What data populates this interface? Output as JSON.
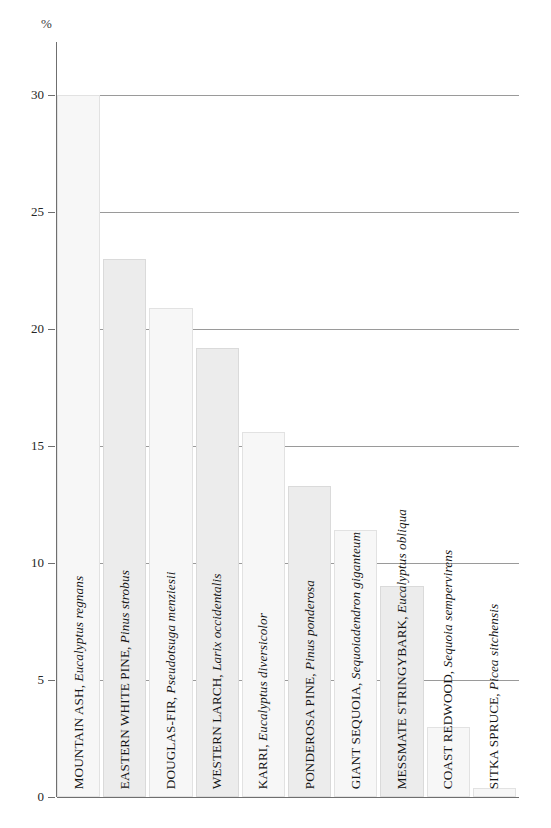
{
  "chart_data": {
    "type": "bar",
    "title": "",
    "subtitle": "",
    "xlabel": "",
    "ylabel": "%",
    "unit_label": "%",
    "ylim": [
      0,
      32
    ],
    "yticks": [
      0,
      5,
      10,
      15,
      20,
      25,
      30
    ],
    "ytick_labels": [
      "0",
      "5",
      "10",
      "15",
      "20",
      "25",
      "30"
    ],
    "grid": true,
    "legend": null,
    "orientation": "vertical",
    "categories": [
      "MOUNTAIN ASH, Eucalyptus regnans",
      "EASTERN WHITE PINE, Pinus strobus",
      "DOUGLAS-FIR, Pseudotsuga menziesii",
      "WESTERN LARCH, Larix occidentalis",
      "KARRI, Eucalyptus diversicolor",
      "PONDEROSA PINE, Pinus ponderosa",
      "GIANT SEQUOIA, Sequoiadendron giganteum",
      "MESSMATE STRINGYBARK, Eucalyptus obliqua",
      "COAST REDWOOD, Sequoia sempervirens",
      "SITKA SPRUCE, Picea sitchensis"
    ],
    "values": [
      30.0,
      23.0,
      20.9,
      19.2,
      15.6,
      13.3,
      11.4,
      9.0,
      3.0,
      0.4
    ],
    "bars": [
      {
        "common": "MOUNTAIN ASH, ",
        "latin": "Eucalyptus regnans",
        "value": 30.0,
        "shade": "a"
      },
      {
        "common": "EASTERN WHITE PINE, ",
        "latin": "Pinus strobus",
        "value": 23.0,
        "shade": "b"
      },
      {
        "common": "DOUGLAS-FIR, ",
        "latin": "Pseudotsuga menziesii",
        "value": 20.9,
        "shade": "a"
      },
      {
        "common": "WESTERN LARCH, ",
        "latin": "Larix occidentalis",
        "value": 19.2,
        "shade": "b"
      },
      {
        "common": "KARRI, ",
        "latin": "Eucalyptus diversicolor",
        "value": 15.6,
        "shade": "a"
      },
      {
        "common": "PONDEROSA PINE, ",
        "latin": "Pinus ponderosa",
        "value": 13.3,
        "shade": "b"
      },
      {
        "common": "GIANT SEQUOIA, ",
        "latin": "Sequoiadendron giganteum",
        "value": 11.4,
        "shade": "a"
      },
      {
        "common": "MESSMATE STRINGYBARK, ",
        "latin": "Eucalyptus obliqua",
        "value": 9.0,
        "shade": "b"
      },
      {
        "common": "COAST REDWOOD, ",
        "latin": "Sequoia sempervirens",
        "value": 3.0,
        "shade": "a"
      },
      {
        "common": "SITKA SPRUCE, ",
        "latin": "Picea sitchensis",
        "value": 0.4,
        "shade": "a"
      }
    ],
    "colors": {
      "bar_light": "#f7f7f7",
      "bar_shade": "#ececec",
      "bar_border": "#dcdcdc",
      "gridline": "#9a9a9a",
      "axis": "#6f6f6f",
      "text": "#141414",
      "background": "#ffffff"
    }
  }
}
